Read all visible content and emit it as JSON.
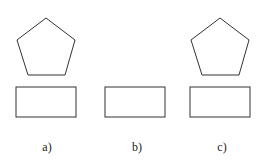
{
  "figure": {
    "panels": [
      {
        "label": "a)",
        "has_pentagon": true
      },
      {
        "label": "b)",
        "has_pentagon": false
      },
      {
        "label": "c)",
        "has_pentagon": true
      }
    ],
    "colors": {
      "stroke": "#333333",
      "background": "#ffffff"
    }
  }
}
